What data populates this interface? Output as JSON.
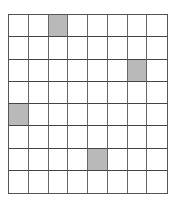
{
  "grid": {
    "rows": 8,
    "cols": 8,
    "cell_color": "#ffffff",
    "shaded_color": "#b9b9b9",
    "line_color": "#555555",
    "shaded_cells": [
      {
        "row": 0,
        "col": 2
      },
      {
        "row": 2,
        "col": 6
      },
      {
        "row": 4,
        "col": 0
      },
      {
        "row": 6,
        "col": 4
      }
    ]
  }
}
